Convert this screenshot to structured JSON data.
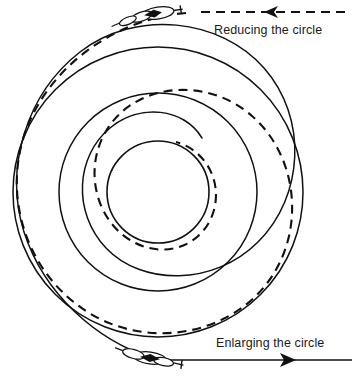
{
  "diagram": {
    "background_color": "#ffffff",
    "stroke_color": "#111111",
    "width": 357,
    "height": 377,
    "center": {
      "x": 158,
      "y": 192
    },
    "labels": {
      "reducing": "Reducing the circle",
      "enlarging": "Enlarging the circle"
    },
    "circles": [
      {
        "name": "inner-circle",
        "radius": 51,
        "style": "solid"
      },
      {
        "name": "middle-circle",
        "radius": 99,
        "style": "solid"
      },
      {
        "name": "outer-circle",
        "radius": 145,
        "style": "solid"
      }
    ],
    "spirals": [
      {
        "name": "reducing-spiral",
        "style": "dashed",
        "direction": "inward",
        "description": "Dashed spiral path tightening from the outer circle toward the inner circle"
      },
      {
        "name": "enlarging-spiral",
        "style": "solid",
        "direction": "outward",
        "description": "Solid spiral path widening from the inner circle toward the outer circle"
      }
    ],
    "arrows": [
      {
        "name": "reducing-arrow",
        "style": "dashed",
        "points": "left",
        "y": 12,
        "from_x": 345,
        "to_x": 200
      },
      {
        "name": "enlarging-arrow",
        "style": "solid",
        "points": "right",
        "y": 360,
        "from_x": 150,
        "to_x": 352
      }
    ],
    "aircraft": [
      {
        "name": "glider-top",
        "x": 158,
        "y": 13,
        "heading": "left-descending"
      },
      {
        "name": "glider-bottom",
        "x": 150,
        "y": 358,
        "heading": "right-ascending"
      }
    ]
  }
}
